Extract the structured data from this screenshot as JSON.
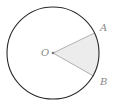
{
  "diagram": {
    "type": "circle-sector",
    "center_label": "O",
    "point_labels": [
      "A",
      "B"
    ],
    "colors": {
      "circle_stroke": "#2a2a2a",
      "sector_fill": "#ececec",
      "radius_stroke": "#b0b0b0",
      "label": "#8a8a8a"
    }
  }
}
